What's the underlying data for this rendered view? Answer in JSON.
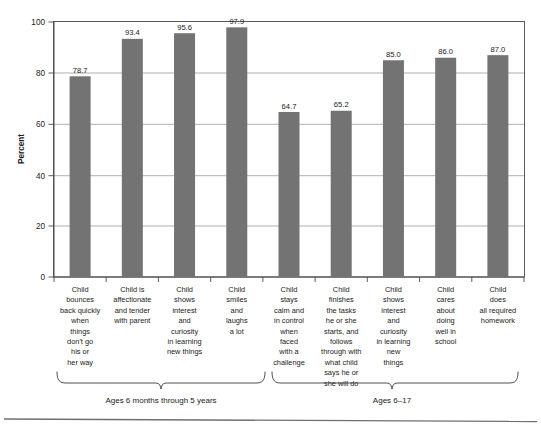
{
  "chart_data": {
    "type": "bar",
    "title": "",
    "subtitle": "",
    "xlabel": "",
    "ylabel": "Percent",
    "ylim": [
      0,
      100
    ],
    "yticks": [
      0,
      20,
      40,
      60,
      80,
      100
    ],
    "ytick_labels": [
      "0",
      "20",
      "40",
      "60",
      "80",
      "100"
    ],
    "grid": "horizontal",
    "legend": "none",
    "bar_color": "#737373",
    "categories": [
      "Child bounces back quickly when things don't go his or her way",
      "Child is affectionate and tender with parent",
      "Child shows interest and curiosity in learning new things",
      "Child smiles and laughs a lot",
      "Child stays calm and in control when faced with a challenge",
      "Child finishes the tasks he or she starts, and follows through with what child says he or she will do",
      "Child shows interest and curiosity in learning new things",
      "Child cares about doing well in school",
      "Child does all required homework"
    ],
    "values": [
      78.7,
      93.4,
      95.6,
      97.9,
      64.7,
      65.2,
      85.0,
      86.0,
      87.0
    ],
    "value_labels": [
      "78.7",
      "93.4",
      "95.6",
      "97.9",
      "64.7",
      "65.2",
      "85.0",
      "86.0",
      "87.0"
    ],
    "category_lines": [
      [
        "Child",
        "bounces",
        "back quickly",
        "when",
        "things",
        "don't go",
        "his or",
        "her way"
      ],
      [
        "Child is",
        "affectionate",
        "and tender",
        "with parent"
      ],
      [
        "Child",
        "shows",
        "interest",
        "and",
        "curiosity",
        "in learning",
        "new things"
      ],
      [
        "Child",
        "smiles",
        "and",
        "laughs",
        "a lot"
      ],
      [
        "Child",
        "stays",
        "calm and",
        "in control",
        "when",
        "faced",
        "with a",
        "challenge"
      ],
      [
        "Child",
        "finishes",
        "the tasks",
        "he or she",
        "starts, and",
        "follows",
        "through with",
        "what child",
        "says he or",
        "she will do"
      ],
      [
        "Child",
        "shows",
        "interest",
        "and",
        "curiosity",
        "in learning",
        "new",
        "things"
      ],
      [
        "Child",
        "cares",
        "about",
        "doing",
        "well in",
        "school"
      ],
      [
        "Child",
        "does",
        "all required",
        "homework"
      ]
    ],
    "groups": [
      {
        "label": "Ages 6 months through 5 years",
        "bar_indices": [
          0,
          1,
          2,
          3
        ]
      },
      {
        "label": "Ages 6–17",
        "bar_indices": [
          4,
          5,
          6,
          7,
          8
        ]
      }
    ]
  }
}
